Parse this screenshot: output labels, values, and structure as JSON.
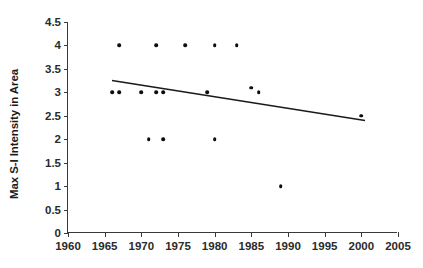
{
  "chart_data": {
    "type": "scatter",
    "title": "",
    "xlabel": "",
    "ylabel": "Max S-I Intensity in Area",
    "xlim": [
      1960,
      2005
    ],
    "ylim": [
      0,
      4.5
    ],
    "xticks": [
      1960,
      1965,
      1970,
      1975,
      1980,
      1985,
      1990,
      1995,
      2000,
      2005
    ],
    "xtick_labels": [
      "1960",
      "1965",
      "1970",
      "1975",
      "1980",
      "1985",
      "1990",
      "1995",
      "2000",
      "2005"
    ],
    "yticks": [
      0,
      0.5,
      1,
      1.5,
      2,
      2.5,
      3,
      3.5,
      4,
      4.5
    ],
    "ytick_labels": [
      "0",
      "0.5",
      "1",
      "1.5",
      "2",
      "2.5",
      "3",
      "3.5",
      "4",
      "4.5"
    ],
    "grid": false,
    "legend": null,
    "marker_color": "#0d0d0d",
    "line_color": "#1a1a1a",
    "axis_color": "#3a3a3a",
    "points": [
      {
        "x": 1966,
        "y": 3
      },
      {
        "x": 1967,
        "y": 3
      },
      {
        "x": 1967,
        "y": 4
      },
      {
        "x": 1970,
        "y": 3
      },
      {
        "x": 1971,
        "y": 2
      },
      {
        "x": 1972,
        "y": 3
      },
      {
        "x": 1972,
        "y": 4
      },
      {
        "x": 1973,
        "y": 3
      },
      {
        "x": 1973,
        "y": 2
      },
      {
        "x": 1976,
        "y": 4
      },
      {
        "x": 1979,
        "y": 3
      },
      {
        "x": 1980,
        "y": 4
      },
      {
        "x": 1980,
        "y": 2
      },
      {
        "x": 1983,
        "y": 4
      },
      {
        "x": 1985,
        "y": 3.1
      },
      {
        "x": 1986,
        "y": 3
      },
      {
        "x": 1989,
        "y": 1
      },
      {
        "x": 2000,
        "y": 2.5
      }
    ],
    "trendline": {
      "type": "linear",
      "x_start": 1966,
      "y_start": 3.25,
      "x_end": 2000.5,
      "y_end": 2.4
    }
  }
}
